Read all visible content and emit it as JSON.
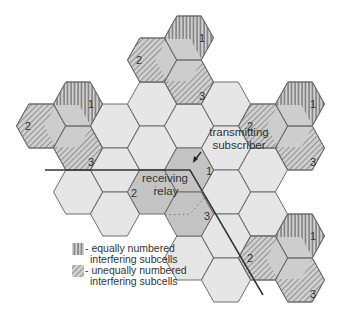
{
  "diagram": {
    "hex_radius": 24.5,
    "hex_half_height": 22,
    "colors": {
      "light_cell": "#e6e6e6",
      "mid_cell": "#c9c9c9",
      "center_cell": "#c4c4c4",
      "stroke": "#6e6e6e",
      "stripe": "#555555"
    },
    "light_cells": [
      [
        115,
        126
      ],
      [
        152,
        104
      ],
      [
        189,
        126
      ],
      [
        226,
        104
      ],
      [
        152,
        148
      ],
      [
        226,
        148
      ],
      [
        115,
        170
      ],
      [
        78,
        192
      ],
      [
        115,
        214
      ],
      [
        226,
        192
      ],
      [
        263,
        170
      ],
      [
        263,
        214
      ],
      [
        226,
        236
      ],
      [
        189,
        258
      ],
      [
        226,
        280
      ]
    ],
    "interfering_clusters": [
      {
        "name": "top",
        "cells": [
          {
            "label": "1",
            "x": 189,
            "y": 38,
            "type": "equal"
          },
          {
            "label": "2",
            "x": 152,
            "y": 60,
            "type": "unequal"
          },
          {
            "label": "3",
            "x": 189,
            "y": 82,
            "type": "unequal"
          }
        ]
      },
      {
        "name": "left",
        "cells": [
          {
            "label": "1",
            "x": 78,
            "y": 104,
            "type": "equal"
          },
          {
            "label": "2",
            "x": 41,
            "y": 126,
            "type": "unequal"
          },
          {
            "label": "3",
            "x": 78,
            "y": 148,
            "type": "unequal"
          }
        ]
      },
      {
        "name": "right",
        "cells": [
          {
            "label": "1",
            "x": 300,
            "y": 104,
            "type": "equal"
          },
          {
            "label": "2",
            "x": 263,
            "y": 126,
            "type": "unequal"
          },
          {
            "label": "3",
            "x": 300,
            "y": 148,
            "type": "unequal"
          }
        ]
      },
      {
        "name": "bottom-right",
        "cells": [
          {
            "label": "1",
            "x": 300,
            "y": 236,
            "type": "equal"
          },
          {
            "label": "2",
            "x": 263,
            "y": 258,
            "type": "unequal"
          },
          {
            "label": "3",
            "x": 300,
            "y": 280,
            "type": "unequal"
          }
        ]
      }
    ],
    "central_cluster": {
      "cells": [
        {
          "label": "1",
          "x": 189,
          "y": 170
        },
        {
          "label": "2",
          "x": 152,
          "y": 192
        },
        {
          "label": "3",
          "x": 189,
          "y": 214
        }
      ]
    },
    "annotations": {
      "transmitting_line1": "transmitting",
      "transmitting_line2": "subscriber",
      "receiving_line1": "receiving",
      "receiving_line2": "relay"
    },
    "labels": {
      "one": "1",
      "two": "2",
      "three": "3"
    },
    "legend": {
      "equal_line1": "- equally numbered",
      "equal_line2": "interfering subcells",
      "unequal_line1": "- unequally numbered",
      "unequal_line2": "interfering subcells"
    }
  }
}
